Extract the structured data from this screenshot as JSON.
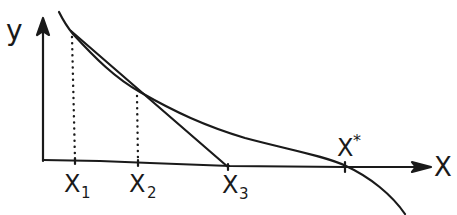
{
  "diagram": {
    "axes": {
      "y_label": "y",
      "x_label": "X"
    },
    "points": [
      {
        "label": "X",
        "sub": "1"
      },
      {
        "label": "X",
        "sub": "2"
      },
      {
        "label": "X",
        "sub": "3"
      },
      {
        "label": "X",
        "sup": "*"
      }
    ],
    "colors": {
      "ink": "#1a1a1a",
      "background": "#ffffff"
    }
  }
}
